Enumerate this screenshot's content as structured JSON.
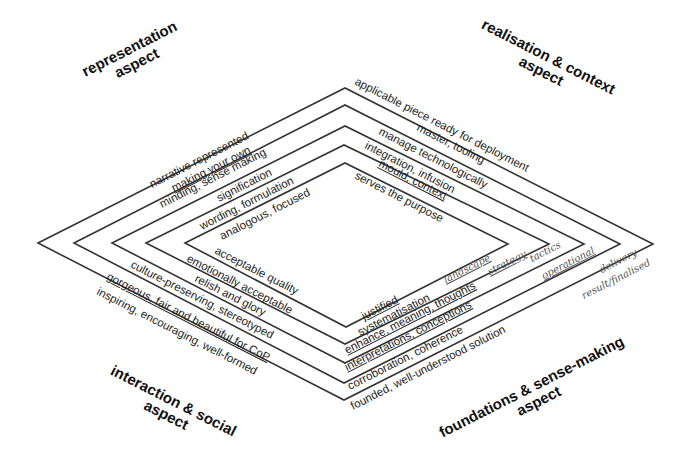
{
  "diagram": {
    "type": "nested-diamonds",
    "stroke_color": "#333333",
    "background": "#ffffff",
    "diamonds": [
      {
        "id": 1,
        "left": [
          38,
          243
        ],
        "top": [
          345,
          88
        ],
        "right": [
          653,
          244
        ],
        "bottom": [
          344,
          400
        ]
      },
      {
        "id": 2,
        "left": [
          74,
          243
        ],
        "top": [
          345,
          105
        ],
        "right": [
          620,
          244
        ],
        "bottom": [
          344,
          383
        ]
      },
      {
        "id": 3,
        "left": [
          112,
          243
        ],
        "top": [
          345,
          126
        ],
        "right": [
          584,
          244
        ],
        "bottom": [
          345,
          363
        ]
      },
      {
        "id": 4,
        "left": [
          146,
          243
        ],
        "top": [
          344,
          145
        ],
        "right": [
          549,
          244
        ],
        "bottom": [
          345,
          344
        ]
      },
      {
        "id": 5,
        "left": [
          185,
          243
        ],
        "top": [
          345,
          163
        ],
        "right": [
          508,
          244
        ],
        "bottom": [
          346,
          327
        ]
      }
    ]
  },
  "aspects": {
    "top_left": {
      "line1": "representation",
      "line2": "aspect"
    },
    "top_right": {
      "line1": "realisation & context",
      "line2": "aspect"
    },
    "bottom_left": {
      "line1": "interaction & social",
      "line2": "aspect"
    },
    "bottom_right": {
      "line1": "foundations & sense-making",
      "line2": "aspect"
    }
  },
  "representation_labels": [
    "narrative represented",
    "making your own",
    "minding, sense making",
    "signification",
    "wording, formulation",
    "analogous, focused"
  ],
  "realisation_labels": [
    "applicable piece ready for deployment",
    "master, tooling",
    "manage technologically",
    "integration, infusion",
    "mould, context",
    "serves the purpose"
  ],
  "interaction_labels": [
    "acceptable quality",
    "emotionally acceptable",
    "relish and glory",
    "culture-preserving, stereotyped",
    "gorgeous, fair and beautiful for CoP",
    "inspiring, encouraging, well-formed"
  ],
  "foundations_labels": [
    "justified",
    "systematisation",
    "enhance, meaning, thoughts",
    "interpretations, conceptions",
    "corroboration, coherence",
    "founded, well-understood  solution"
  ],
  "level_labels": [
    "landscape",
    "strategy",
    "tactics",
    "operational",
    "delivery",
    "result/finalised"
  ]
}
